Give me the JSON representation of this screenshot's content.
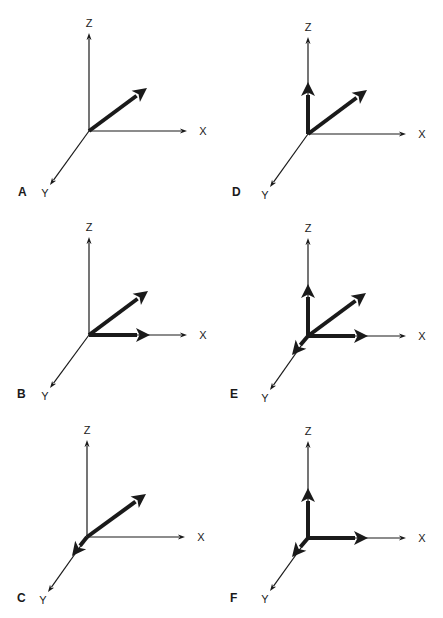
{
  "figure": {
    "axis_labels": {
      "x": "X",
      "y": "Y",
      "z": "Z"
    },
    "colors": {
      "ink": "#1a1a1a",
      "background": "#ffffff"
    },
    "caption_visible_text": "",
    "panels": [
      {
        "id": "A",
        "label": "A",
        "origin": [
          89,
          131
        ],
        "z_end": [
          89,
          33
        ],
        "x_end": [
          187,
          131
        ],
        "y_end": [
          50,
          185
        ],
        "label_pos": [
          18,
          196
        ],
        "vectors": [
          {
            "name": "resultant",
            "to": [
              147,
              88
            ]
          }
        ]
      },
      {
        "id": "D",
        "label": "D",
        "origin": [
          308,
          134
        ],
        "z_end": [
          308,
          37
        ],
        "x_end": [
          406,
          134
        ],
        "y_end": [
          270,
          187
        ],
        "label_pos": [
          232,
          196
        ],
        "vectors": [
          {
            "name": "resultant",
            "to": [
              367,
              90
            ]
          },
          {
            "name": "z-component",
            "to": [
              308,
              82
            ]
          }
        ]
      },
      {
        "id": "B",
        "label": "B",
        "origin": [
          89,
          335
        ],
        "z_end": [
          89,
          237
        ],
        "x_end": [
          187,
          335
        ],
        "y_end": [
          50,
          388
        ],
        "label_pos": [
          17,
          398
        ],
        "vectors": [
          {
            "name": "resultant",
            "to": [
              148,
              291
            ]
          },
          {
            "name": "x-component",
            "to": [
              150,
              335
            ]
          }
        ]
      },
      {
        "id": "E",
        "label": "E",
        "origin": [
          308,
          336
        ],
        "z_end": [
          308,
          238
        ],
        "x_end": [
          406,
          336
        ],
        "y_end": [
          270,
          390
        ],
        "label_pos": [
          230,
          398
        ],
        "vectors": [
          {
            "name": "resultant",
            "to": [
              366,
              293
            ]
          },
          {
            "name": "z-component",
            "to": [
              308,
              284
            ]
          },
          {
            "name": "x-component",
            "to": [
              368,
              336
            ]
          },
          {
            "name": "y-component",
            "to": [
              292,
              355
            ]
          }
        ]
      },
      {
        "id": "C",
        "label": "C",
        "origin": [
          87,
          537
        ],
        "z_end": [
          87,
          440
        ],
        "x_end": [
          185,
          537
        ],
        "y_end": [
          48,
          592
        ],
        "label_pos": [
          17,
          602
        ],
        "vectors": [
          {
            "name": "resultant",
            "to": [
              146,
              494
            ]
          },
          {
            "name": "y-component",
            "to": [
              72,
              556
            ]
          }
        ]
      },
      {
        "id": "F",
        "label": "F",
        "origin": [
          308,
          538
        ],
        "z_end": [
          308,
          441
        ],
        "x_end": [
          406,
          538
        ],
        "y_end": [
          270,
          591
        ],
        "label_pos": [
          230,
          602
        ],
        "vectors": [
          {
            "name": "z-component",
            "to": [
              308,
              488
            ]
          },
          {
            "name": "x-component",
            "to": [
              368,
              538
            ]
          },
          {
            "name": "y-component",
            "to": [
              292,
              557
            ]
          }
        ]
      }
    ]
  }
}
